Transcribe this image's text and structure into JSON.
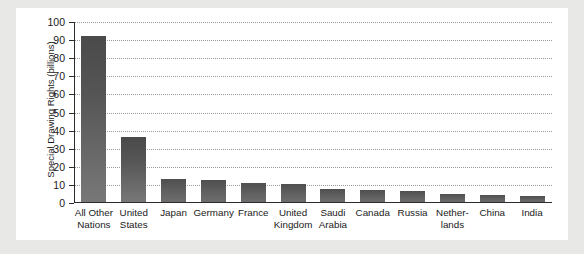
{
  "chart_data": {
    "type": "bar",
    "title": "",
    "subtitle": "",
    "xlabel": "",
    "ylabel": "Special Drawing Rights (billions)",
    "ylim": [
      0,
      100
    ],
    "ytick_labels": [
      "100",
      "90",
      "80",
      "70",
      "60",
      "50",
      "40",
      "30",
      "20",
      "10",
      "0"
    ],
    "ytick_values": [
      100,
      90,
      80,
      70,
      60,
      50,
      40,
      30,
      20,
      10,
      0
    ],
    "grid": true,
    "legend": false,
    "legend_position": "none",
    "categories": [
      "All Other Nations",
      "United States",
      "Japan",
      "Germany",
      "France",
      "United Kingdom",
      "Saudi Arabia",
      "Canada",
      "Russia",
      "Netherlands",
      "China",
      "India"
    ],
    "category_lines": [
      [
        "All Other",
        "Nations"
      ],
      [
        "United",
        "States"
      ],
      [
        "Japan"
      ],
      [
        "Germany"
      ],
      [
        "France"
      ],
      [
        "United",
        "Kingdom"
      ],
      [
        "Saudi",
        "Arabia"
      ],
      [
        "Canada"
      ],
      [
        "Russia"
      ],
      [
        "Nether-",
        "lands"
      ],
      [
        "China"
      ],
      [
        "India"
      ]
    ],
    "values": [
      92.5,
      36.5,
      13.3,
      12.9,
      10.8,
      10.3,
      7.9,
      7.2,
      6.5,
      5.1,
      4.2,
      3.6
    ],
    "series": [
      {
        "name": "Special Drawing Rights",
        "values": [
          92.5,
          36.5,
          13.3,
          12.9,
          10.8,
          10.3,
          7.9,
          7.2,
          6.5,
          5.1,
          4.2,
          3.6
        ]
      }
    ]
  },
  "colors": {
    "bar_top": "#4a4a4a",
    "bar_bottom": "#787878",
    "axis": "#2b2b2b",
    "gridline": "#9a9a9a",
    "plot_background": "#ffffff",
    "page_background": "#e8e8e6",
    "text": "#1a1a1a"
  }
}
